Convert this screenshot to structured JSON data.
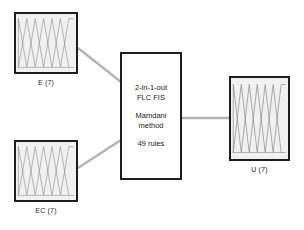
{
  "diagram": {
    "background": "#ffffff",
    "stroke_color": "#1d1d1d",
    "panel_fill": "#f1f1f1",
    "link_color": "#b3b3b3"
  },
  "nodes": {
    "input_e": {
      "caption": "E (7)",
      "kind": "membership-function-panel",
      "sets": 7
    },
    "input_ec": {
      "caption": "EC (7)",
      "kind": "membership-function-panel",
      "sets": 7
    },
    "output_u": {
      "caption": "U (7)",
      "kind": "membership-function-panel",
      "sets": 7
    },
    "fis": {
      "lines": [
        {
          "line1": "2-in-1-out",
          "line2": "FLC FIS"
        },
        {
          "line1": "Mamdani",
          "line2": "method"
        },
        {
          "line1": "49 rules",
          "line2": ""
        }
      ]
    }
  },
  "links": [
    {
      "from": "input_e",
      "to": "fis"
    },
    {
      "from": "input_ec",
      "to": "fis"
    },
    {
      "from": "fis",
      "to": "output_u"
    }
  ]
}
